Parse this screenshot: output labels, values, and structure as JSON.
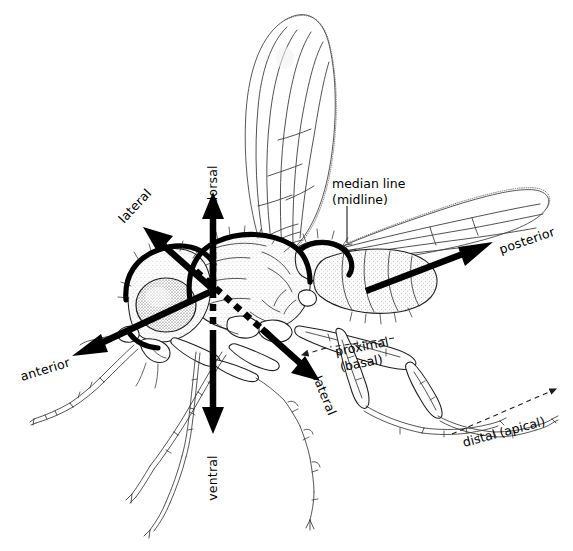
{
  "figure": {
    "background_color": "#ffffff",
    "ink_color": "#000000",
    "width": 573,
    "height": 551
  },
  "axes": [
    {
      "id": "dorsal",
      "label": "dorsal",
      "direction": "up",
      "arrow_style": "solid",
      "label_rotation_deg": -90,
      "label_x": 210,
      "label_y": 175,
      "arrow_from": {
        "x": 213,
        "y": 290
      },
      "arrow_to": {
        "x": 213,
        "y": 196
      }
    },
    {
      "id": "ventral",
      "label": "ventral",
      "direction": "down",
      "arrow_style": "solid",
      "label_rotation_deg": -90,
      "label_x": 210,
      "label_y": 468,
      "arrow_from": {
        "x": 213,
        "y": 290
      },
      "arrow_to": {
        "x": 213,
        "y": 432
      }
    },
    {
      "id": "anterior",
      "label": "anterior",
      "direction": "left",
      "arrow_style": "solid",
      "label_rotation_deg": -17,
      "label_x": 20,
      "label_y": 380,
      "arrow_from": {
        "x": 213,
        "y": 290
      },
      "arrow_to": {
        "x": 72,
        "y": 355
      }
    },
    {
      "id": "posterior",
      "label": "posterior",
      "direction": "right",
      "arrow_style": "solid",
      "label_rotation_deg": -19,
      "label_x": 500,
      "label_y": 252,
      "arrow_from": {
        "x": 213,
        "y": 290
      },
      "arrow_to": {
        "x": 492,
        "y": 243
      }
    },
    {
      "id": "lateral-upper-left",
      "label": "lateral",
      "direction": "upper-left",
      "arrow_style": "solid",
      "label_rotation_deg": -47,
      "label_x": 122,
      "label_y": 222,
      "arrow_from": {
        "x": 213,
        "y": 290
      },
      "arrow_to": {
        "x": 143,
        "y": 228
      }
    },
    {
      "id": "lateral-lower-right",
      "label": "lateral",
      "direction": "lower-right",
      "arrow_style": "dashed-over-body",
      "label_rotation_deg": 68,
      "label_x": 316,
      "label_y": 378,
      "arrow_from": {
        "x": 213,
        "y": 290
      },
      "arrow_to": {
        "x": 318,
        "y": 380
      }
    }
  ],
  "callouts": [
    {
      "id": "median-line",
      "lines": [
        "median line",
        "(midline)"
      ],
      "label_x": 332,
      "label_y": 187,
      "rotation_deg": 0,
      "leader_style": "solid",
      "leader_from": {
        "x": 347,
        "y": 205
      },
      "leader_to": {
        "x": 347,
        "y": 243
      }
    },
    {
      "id": "proximal-basal",
      "lines": [
        "proximal",
        "(basal)"
      ],
      "label_x": 339,
      "label_y": 356,
      "rotation_deg": -11,
      "leader_style": "dashed-arrow-left",
      "leader_from": {
        "x": 392,
        "y": 341
      },
      "leader_to": {
        "x": 302,
        "y": 356
      }
    },
    {
      "id": "distal-apical",
      "lines": [
        "distal (apical)"
      ],
      "label_x": 466,
      "label_y": 441,
      "rotation_deg": -15,
      "leader_style": "dashed-arrow-right",
      "leader_from": {
        "x": 455,
        "y": 432
      },
      "leader_to": {
        "x": 560,
        "y": 390
      }
    }
  ],
  "anatomy_parts": [
    "head",
    "compound-eye",
    "antenna",
    "proboscis",
    "thorax",
    "scutellum",
    "abdomen",
    "raised-wing",
    "extended-wing",
    "foreleg",
    "midleg",
    "hindleg",
    "halteres"
  ]
}
